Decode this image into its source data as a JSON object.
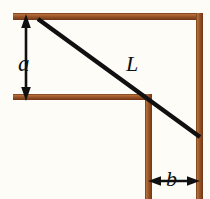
{
  "figure": {
    "background_color": "#fdfcf7",
    "beam_color": "#8a4a20",
    "beam_highlight_color": "#c07a40",
    "line_color": "#101010",
    "labels": {
      "a": "a",
      "L": "L",
      "b": "b"
    },
    "dimensions": {
      "a_description": "vertical distance from upper wall top to the lower horizontal wall",
      "b_description": "horizontal distance between the inner vertical wall and the outer vertical wall",
      "L_description": "length of the straight ladder spanning the corner"
    },
    "geometry": {
      "top_beam": {
        "x1": 13,
        "y1": 13,
        "x2": 203,
        "y2": 20
      },
      "middle_beam": {
        "x1": 13,
        "y1": 94,
        "x2": 152,
        "y2": 100
      },
      "right_vertical_beam": {
        "x1": 196,
        "y1": 13,
        "x2": 203,
        "y2": 199
      },
      "inner_vertical_beam": {
        "x1": 145,
        "y1": 94,
        "x2": 152,
        "y2": 199
      },
      "ladder": {
        "x1": 38,
        "y1": 19,
        "x2": 200,
        "y2": 137
      },
      "arrow_a": {
        "x": 26,
        "y_top": 17,
        "y_bottom": 98
      },
      "arrow_b": {
        "y": 181,
        "x_left": 150,
        "x_right": 198
      }
    }
  }
}
